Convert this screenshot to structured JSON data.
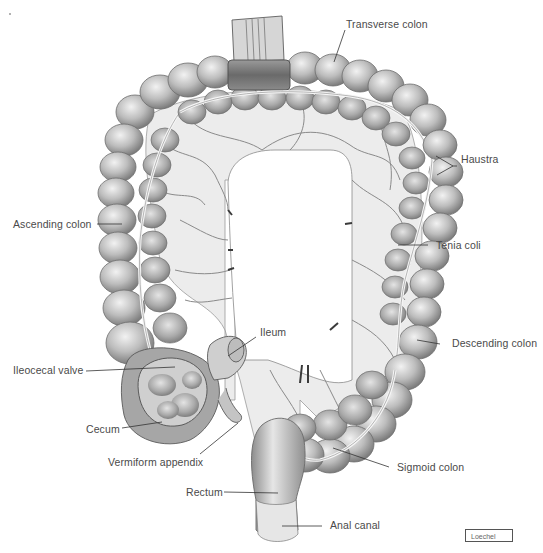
{
  "figure": {
    "colors": {
      "background": "#ffffff",
      "tissue_light": "#d9d9d9",
      "tissue_mid": "#b3b3b3",
      "tissue_dark": "#7a7a7a",
      "outline": "#555555",
      "mesentery": "#ececec",
      "vessel": "#8a8a8a",
      "label_text": "#4a4a4a",
      "leader_line": "#333333"
    },
    "labels": [
      {
        "id": "transverse-colon",
        "text": "Transverse colon"
      },
      {
        "id": "haustra",
        "text": "Haustra"
      },
      {
        "id": "ascending-colon",
        "text": "Ascending colon"
      },
      {
        "id": "tenia-coli",
        "text": "Tenia coli"
      },
      {
        "id": "ileum",
        "text": "Ileum"
      },
      {
        "id": "descending-colon",
        "text": "Descending colon"
      },
      {
        "id": "ileocecal-valve",
        "text": "Ileocecal valve"
      },
      {
        "id": "cecum",
        "text": "Cecum"
      },
      {
        "id": "vermiform-appendix",
        "text": "Vermiform appendix"
      },
      {
        "id": "sigmoid-colon",
        "text": "Sigmoid colon"
      },
      {
        "id": "rectum",
        "text": "Rectum"
      },
      {
        "id": "anal-canal",
        "text": "Anal canal"
      }
    ],
    "credit": "Loechel"
  }
}
